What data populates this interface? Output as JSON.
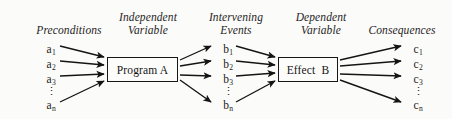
{
  "diagram": {
    "background_color": "#fbfbf9",
    "ink_color": "#1b1b1b",
    "columns": [
      {
        "id": "preconditions",
        "header": "Preconditions"
      },
      {
        "id": "independent-variable",
        "header": "Independent\nVariable"
      },
      {
        "id": "intervening-events",
        "header": "Intervening\nEvents"
      },
      {
        "id": "dependent-variable",
        "header": "Dependent\nVariable"
      },
      {
        "id": "consequences",
        "header": "Consequences"
      }
    ],
    "preconditions": {
      "header": "Preconditions",
      "items": [
        {
          "base": "a",
          "sub": "1"
        },
        {
          "base": "a",
          "sub": "2"
        },
        {
          "base": "a",
          "sub": "3"
        },
        {
          "base": "a",
          "sub": "n"
        }
      ],
      "ellipsis": "⋮"
    },
    "independent_variable": {
      "header": "Independent\nVariable",
      "box_label": "Program A"
    },
    "intervening_events": {
      "header": "Intervening\nEvents",
      "items": [
        {
          "base": "b",
          "sub": "1"
        },
        {
          "base": "b",
          "sub": "2"
        },
        {
          "base": "b",
          "sub": "3"
        },
        {
          "base": "b",
          "sub": "n"
        }
      ],
      "ellipsis": "⋮"
    },
    "dependent_variable": {
      "header": "Dependent\nVariable",
      "box_label": "Effect  B"
    },
    "consequences": {
      "header": "Consequences",
      "items": [
        {
          "base": "c",
          "sub": "1"
        },
        {
          "base": "c",
          "sub": "2"
        },
        {
          "base": "c",
          "sub": "3"
        },
        {
          "base": "c",
          "sub": "n"
        }
      ],
      "ellipsis": "⋮"
    },
    "arrow_groups": [
      {
        "name": "preconditions-to-program",
        "count": 4,
        "direction": "converging"
      },
      {
        "name": "program-to-intervening",
        "count": 4,
        "direction": "diverging"
      },
      {
        "name": "intervening-to-effect",
        "count": 4,
        "direction": "converging"
      },
      {
        "name": "effect-to-consequences",
        "count": 4,
        "direction": "diverging"
      }
    ]
  }
}
